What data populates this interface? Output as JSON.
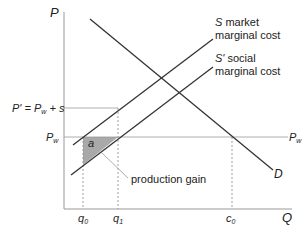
{
  "diagram": {
    "axes": {
      "y_label": "P",
      "x_label": "Q"
    },
    "price_labels": {
      "p_prime": "P' = Pw + s",
      "pw_left": "Pw",
      "pw_right": "Pw"
    },
    "quantity_labels": {
      "q0": "q0",
      "q1": "q1",
      "c0": "c0"
    },
    "curves": {
      "S": {
        "symbol": "S",
        "line1": "market",
        "line2": "marginal cost"
      },
      "S_prime": {
        "symbol": "S'",
        "line1": "social",
        "line2": "marginal cost"
      },
      "D": {
        "symbol": "D"
      }
    },
    "areas": {
      "a": {
        "label": "a",
        "annotation": "production gain",
        "fill": "#a9a9a9"
      }
    },
    "colors": {
      "line": "#333333",
      "guide": "#999999"
    }
  }
}
